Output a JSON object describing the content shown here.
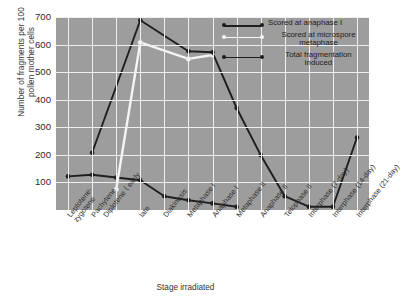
{
  "chart_data": {
    "type": "line",
    "title": "",
    "xlabel": "Stage irradiated",
    "ylabel": "Number of fragments per 100 pollen mother cells",
    "ylim": [
      0,
      700
    ],
    "yticks": [
      100,
      200,
      300,
      400,
      500,
      600,
      700
    ],
    "grid": true,
    "legend_position": "top-right",
    "categories": [
      "Leptotene-zygotene",
      "Pachytene",
      "Diplotene — early",
      "Diplotene — late",
      "Diakinesis",
      "Metaphase I",
      "Anaphase I",
      "Metaphase II",
      "Anaphase II",
      "Telophase II",
      "Interphase (7-day)",
      "Interphase (14-day)",
      "Interphase (21-day)"
    ],
    "series": [
      {
        "name": "Scored at anaphase I",
        "color": "#1e1e1e",
        "marker": "filled-circle",
        "x": [
          0,
          1,
          2,
          3,
          4,
          5,
          6,
          7
        ],
        "values": [
          122,
          128,
          118,
          108,
          50,
          35,
          24,
          12
        ]
      },
      {
        "name": "Scored at microspore metaphase",
        "color": "#f5f5f5",
        "marker": "open-circle",
        "x": [
          2,
          3,
          5,
          6
        ],
        "values": [
          75,
          608,
          548,
          562
        ]
      },
      {
        "name": "Total fragmentation induced",
        "color": "#1e1e1e",
        "marker": "filled-circle",
        "x": [
          1,
          3,
          5,
          6,
          7,
          8,
          9,
          10,
          11,
          12
        ],
        "values": [
          208,
          688,
          576,
          572,
          370,
          199,
          50,
          12,
          12,
          263
        ]
      }
    ]
  },
  "axes": {
    "y_title_line1": "Number of fragments per 100",
    "y_title_line2": "pollen mother cells",
    "x_title": "Stage irradiated"
  },
  "xtick_labels": [
    {
      "line1": "Leptotene-",
      "line2": "zygotene"
    },
    {
      "line1": "Pachytene",
      "line2": ""
    },
    {
      "line1": "Diplotene",
      "line2": "early"
    },
    {
      "line1": "late",
      "line2": ""
    },
    {
      "line1": "Diakinesis",
      "line2": ""
    },
    {
      "line1": "Metaphase I",
      "line2": ""
    },
    {
      "line1": "Anaphase I",
      "line2": ""
    },
    {
      "line1": "Metaphase II",
      "line2": ""
    },
    {
      "line1": "Anaphase II",
      "line2": ""
    },
    {
      "line1": "Telophase II",
      "line2": ""
    },
    {
      "line1": "Interphase (7-day)",
      "line2": ""
    },
    {
      "line1": "Interphase (14-day)",
      "line2": ""
    },
    {
      "line1": "Interphase (21-day)",
      "line2": ""
    }
  ],
  "legend": {
    "entries": [
      {
        "label_line1": "Scored at anaphase I",
        "label_line2": "",
        "color": "#1e1e1e"
      },
      {
        "label_line1": "Scored at microspore",
        "label_line2": "metaphase",
        "color": "#f7f7f7"
      },
      {
        "label_line1": "Total fragmentation",
        "label_line2": "induced",
        "color": "#1e1e1e"
      }
    ]
  },
  "colors": {
    "plot_background": "#9d9d9d",
    "grid": "#efefef",
    "dark_series": "#1e1e1e",
    "light_series": "#f7f7f7",
    "page_background": "#ffffff"
  }
}
